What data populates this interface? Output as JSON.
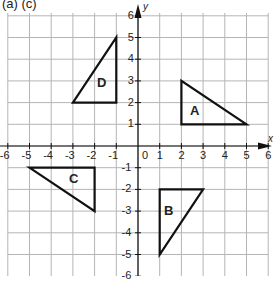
{
  "title": "(a) (c)",
  "axes": {
    "x_name": "x",
    "y_name": "y",
    "x_ticks": [
      "-6",
      "-5",
      "-4",
      "-3",
      "-2",
      "-1",
      "0",
      "1",
      "2",
      "3",
      "4",
      "5",
      "6"
    ],
    "y_ticks_pos": [
      "1",
      "2",
      "3",
      "4",
      "5",
      "6"
    ],
    "y_ticks_neg": [
      "-1",
      "-2",
      "-3",
      "-4",
      "-5",
      "-6"
    ]
  },
  "colors": {
    "grid": "#b5b5b5",
    "axis": "#111111",
    "shape": "#111111",
    "background": "#ffffff"
  },
  "chart_data": {
    "type": "coordinate-grid",
    "title": "(a) (c)",
    "xlim": [
      -6,
      6
    ],
    "ylim": [
      -6,
      6
    ],
    "grid": true,
    "xlabel": "x",
    "ylabel": "y",
    "shapes": [
      {
        "label": "A",
        "type": "triangle",
        "vertices": [
          [
            2,
            3
          ],
          [
            2,
            1
          ],
          [
            5,
            1
          ]
        ]
      },
      {
        "label": "B",
        "type": "triangle",
        "vertices": [
          [
            1,
            -2
          ],
          [
            3,
            -2
          ],
          [
            1,
            -5
          ]
        ]
      },
      {
        "label": "C",
        "type": "triangle",
        "vertices": [
          [
            -5,
            -1
          ],
          [
            -2,
            -1
          ],
          [
            -2,
            -3
          ]
        ]
      },
      {
        "label": "D",
        "type": "triangle",
        "vertices": [
          [
            -1,
            5
          ],
          [
            -1,
            2
          ],
          [
            -3,
            2
          ]
        ]
      }
    ]
  },
  "shapes": {
    "A": "A",
    "B": "B",
    "C": "C",
    "D": "D"
  }
}
